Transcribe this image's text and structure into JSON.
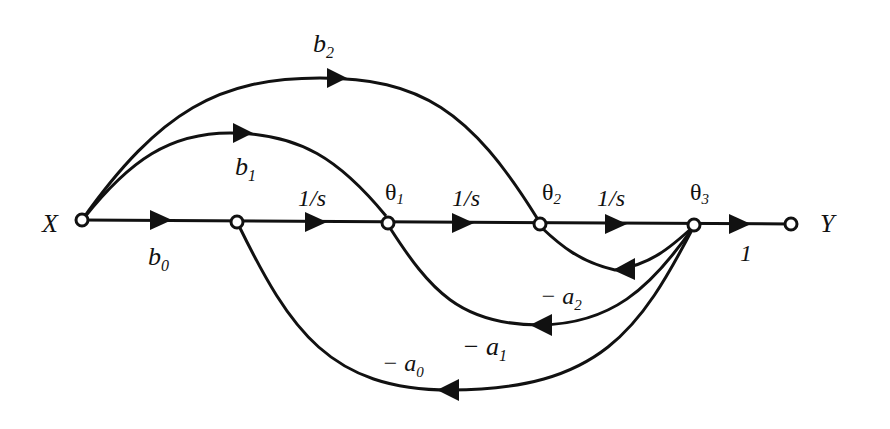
{
  "diagram": {
    "type": "signal-flow-graph",
    "nodes": {
      "input": {
        "label": "X"
      },
      "output": {
        "label": "Y"
      },
      "states": [
        {
          "label": "θ",
          "sub": "1"
        },
        {
          "label": "θ",
          "sub": "2"
        },
        {
          "label": "θ",
          "sub": "3"
        }
      ]
    },
    "forward_gains": {
      "b0": {
        "base": "b",
        "sub": "0"
      },
      "integrator_1": "1/s",
      "integrator_2": "1/s",
      "integrator_3": "1/s",
      "output_gain": "1"
    },
    "feedforward_gains": {
      "b1": {
        "base": "b",
        "sub": "1"
      },
      "b2": {
        "base": "b",
        "sub": "2"
      }
    },
    "feedback_gains": {
      "a0": {
        "base": "− a",
        "sub": "0"
      },
      "a1": {
        "base": "− a",
        "sub": "1"
      },
      "a2": {
        "base": "− a",
        "sub": "2"
      }
    }
  }
}
